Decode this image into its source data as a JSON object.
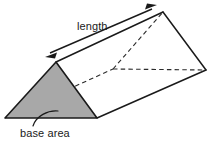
{
  "figure": {
    "type": "triangular-prism-diagram",
    "labels": {
      "length": "length",
      "base_area": "base area"
    },
    "colors": {
      "background": "#ffffff",
      "stroke": "#1a1a1a",
      "base_fill": "#a8a8a8",
      "dashed_stroke": "#2b2b2b",
      "text": "#1a1a1a"
    },
    "geometry": {
      "front_triangle": {
        "name": "base area (shaded front face)",
        "apex": [
          56,
          62
        ],
        "left": [
          5,
          118
        ],
        "right": [
          97,
          118
        ]
      },
      "back_triangle": {
        "name": "rear face",
        "top": [
          163,
          12
        ],
        "hidden": [
          113,
          69
        ],
        "right": [
          206,
          70
        ]
      },
      "visible_edges": [
        [
          [
            56,
            62
          ],
          [
            163,
            12
          ]
        ],
        [
          [
            97,
            118
          ],
          [
            206,
            70
          ]
        ],
        [
          [
            163,
            12
          ],
          [
            206,
            70
          ]
        ],
        [
          [
            56,
            62
          ],
          [
            5,
            118
          ]
        ],
        [
          [
            56,
            62
          ],
          [
            97,
            118
          ]
        ],
        [
          [
            5,
            118
          ],
          [
            97,
            118
          ]
        ]
      ],
      "hidden_edges": [
        [
          [
            5,
            118
          ],
          [
            113,
            69
          ]
        ],
        [
          [
            113,
            69
          ],
          [
            163,
            12
          ]
        ],
        [
          [
            113,
            69
          ],
          [
            206,
            70
          ]
        ]
      ],
      "length_arrow": {
        "from": [
          47,
          55
        ],
        "to": [
          155,
          7
        ],
        "double_headed": true
      },
      "base_area_leader": {
        "from": [
          35,
          126
        ],
        "to": [
          57,
          112
        ],
        "curved": true
      }
    }
  }
}
